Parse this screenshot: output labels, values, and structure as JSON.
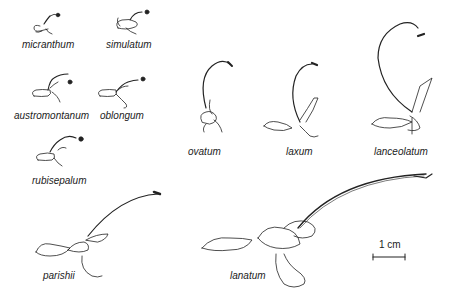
{
  "figure": {
    "caption_fragment": "(drawings of flowers, cropped)",
    "scale_bar": {
      "label": "1 cm"
    },
    "specimens": [
      {
        "id": "micranthum",
        "label": "micranthum"
      },
      {
        "id": "simulatum",
        "label": "simulatum"
      },
      {
        "id": "austromontanum",
        "label": "austromontanum"
      },
      {
        "id": "oblongum",
        "label": "oblongum"
      },
      {
        "id": "rubisepalum",
        "label": "rubisepalum"
      },
      {
        "id": "ovatum",
        "label": "ovatum"
      },
      {
        "id": "laxum",
        "label": "laxum"
      },
      {
        "id": "lanceolatum",
        "label": "lanceolatum"
      },
      {
        "id": "parishii",
        "label": "parishii"
      },
      {
        "id": "lanatum",
        "label": "lanatum"
      }
    ]
  }
}
